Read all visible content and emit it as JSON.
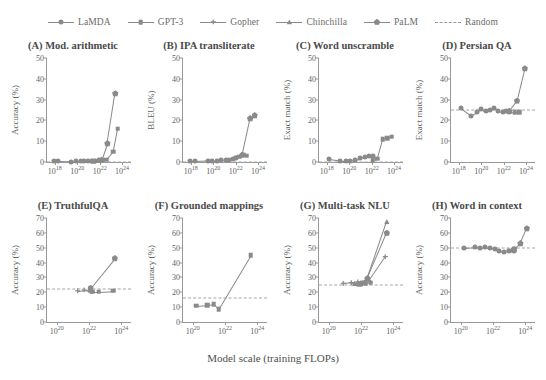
{
  "legend": {
    "items": [
      {
        "label": "LaMDA",
        "marker": "circle",
        "style": "solid"
      },
      {
        "label": "GPT-3",
        "marker": "square",
        "style": "solid"
      },
      {
        "label": "Gopher",
        "marker": "plus",
        "style": "solid"
      },
      {
        "label": "Chinchilla",
        "marker": "triangle",
        "style": "solid"
      },
      {
        "label": "PaLM",
        "marker": "pentagon",
        "style": "solid"
      },
      {
        "label": "Random",
        "marker": "none",
        "style": "dashed"
      }
    ]
  },
  "axis_caption": "Model scale (training FLOPs)",
  "colors": {
    "line": "#8a8a8a",
    "random": "#a5a5a5",
    "axis": "#999999",
    "text": "#5f5f5f",
    "title": "#4a4a4a",
    "background": "#ffffff"
  },
  "chart_data": [
    {
      "id": "A",
      "type": "line",
      "title": "(A) Mod. arithmetic",
      "xlabel": "",
      "ylabel": "Accuracy (%)",
      "xlim_log10": [
        17.3,
        24.8
      ],
      "ylim": [
        0,
        50
      ],
      "yticks": [
        0,
        10,
        20,
        30,
        40,
        50
      ],
      "xticks_log10": [
        18,
        20,
        22,
        24
      ],
      "xticklabels": [
        "10^18",
        "10^20",
        "10^22",
        "10^24"
      ],
      "grid": false,
      "random_baseline": 0,
      "series": [
        {
          "name": "LaMDA",
          "marker": "circle",
          "x_log10": [
            17.9,
            18.3,
            19.4,
            19.9,
            20.3,
            20.6,
            21.0,
            21.3,
            21.6,
            21.9
          ],
          "y": [
            0.3,
            0.3,
            0.2,
            0.4,
            0.3,
            0.5,
            0.4,
            0.6,
            0.5,
            0.8
          ]
        },
        {
          "name": "GPT-3",
          "marker": "square",
          "x_log10": [
            21.4,
            21.9,
            22.2,
            22.6,
            23.2,
            23.6
          ],
          "y": [
            0.4,
            0.6,
            1.0,
            1.2,
            5.0,
            16.0
          ]
        },
        {
          "name": "PaLM",
          "marker": "pentagon",
          "x_log10": [
            22.2,
            22.7,
            23.4
          ],
          "y": [
            1.0,
            9.0,
            33.0
          ]
        }
      ]
    },
    {
      "id": "B",
      "type": "line",
      "title": "(B) IPA transliterate",
      "xlabel": "",
      "ylabel": "BLEU (%)",
      "xlim_log10": [
        17.3,
        24.8
      ],
      "ylim": [
        0,
        50
      ],
      "yticks": [
        0,
        10,
        20,
        30,
        40,
        50
      ],
      "xticks_log10": [
        18,
        20,
        22,
        24
      ],
      "xticklabels": [
        "10^18",
        "10^20",
        "10^22",
        "10^24"
      ],
      "grid": false,
      "random_baseline": 0,
      "series": [
        {
          "name": "LaMDA",
          "marker": "circle",
          "x_log10": [
            17.9,
            18.4,
            19.5,
            19.9,
            20.3,
            20.7,
            21.1,
            21.4,
            21.8,
            22.0
          ],
          "y": [
            0.4,
            0.4,
            0.6,
            0.7,
            0.7,
            0.9,
            1.0,
            1.2,
            1.6,
            2.0
          ]
        },
        {
          "name": "GPT-3",
          "marker": "square",
          "x_log10": [
            22.0,
            22.3,
            22.7,
            23.0
          ],
          "y": [
            2.0,
            2.5,
            3.5,
            3.0
          ]
        },
        {
          "name": "PaLM",
          "marker": "pentagon",
          "x_log10": [
            22.6,
            23.3,
            23.7
          ],
          "y": [
            3.5,
            21.0,
            22.5
          ]
        }
      ]
    },
    {
      "id": "C",
      "type": "line",
      "title": "(C) Word unscramble",
      "xlabel": "",
      "ylabel": "Exact match (%)",
      "xlim_log10": [
        17.3,
        24.8
      ],
      "ylim": [
        0,
        50
      ],
      "yticks": [
        0,
        10,
        20,
        30,
        40,
        50
      ],
      "xticks_log10": [
        18,
        20,
        22,
        24
      ],
      "xticklabels": [
        "10^18",
        "10^20",
        "10^22",
        "10^24"
      ],
      "grid": false,
      "random_baseline": 0,
      "series": [
        {
          "name": "LaMDA",
          "marker": "circle",
          "x_log10": [
            18.2,
            19.2,
            19.7,
            20.1,
            20.5,
            21.0,
            21.4,
            21.8,
            22.1
          ],
          "y": [
            1.3,
            0.5,
            0.5,
            0.7,
            1.2,
            1.8,
            2.4,
            3.0,
            2.8
          ]
        },
        {
          "name": "GPT-3",
          "marker": "square",
          "x_log10": [
            22.1,
            22.5,
            23.0,
            23.4,
            23.8
          ],
          "y": [
            1.0,
            1.5,
            11.0,
            11.5,
            12.2
          ]
        }
      ]
    },
    {
      "id": "D",
      "type": "line",
      "title": "(D) Persian QA",
      "xlabel": "",
      "ylabel": "Exact match (%)",
      "xlim_log10": [
        17.3,
        24.8
      ],
      "ylim": [
        0,
        50
      ],
      "yticks": [
        0,
        10,
        20,
        30,
        40,
        50
      ],
      "xticks_log10": [
        18,
        20,
        22,
        24
      ],
      "xticklabels": [
        "10^18",
        "10^20",
        "10^22",
        "10^24"
      ],
      "grid": false,
      "random_baseline": 25,
      "series": [
        {
          "name": "LaMDA",
          "marker": "circle",
          "x_log10": [
            18.2,
            19.1,
            19.6,
            20.0,
            20.4,
            20.8,
            21.1,
            21.5,
            21.9,
            22.2,
            22.5
          ],
          "y": [
            26.0,
            22.3,
            24.0,
            25.5,
            24.3,
            25.0,
            26.0,
            24.5,
            24.0,
            24.5,
            24.2
          ]
        },
        {
          "name": "GPT-3",
          "marker": "square",
          "x_log10": [
            22.5,
            23.0,
            23.4
          ],
          "y": [
            24.2,
            24.0,
            24.0
          ]
        },
        {
          "name": "PaLM",
          "marker": "pentagon",
          "x_log10": [
            22.5,
            23.2,
            23.9
          ],
          "y": [
            24.5,
            29.5,
            45.0
          ]
        }
      ]
    },
    {
      "id": "E",
      "type": "line",
      "title": "(E) TruthfulQA",
      "xlabel": "",
      "ylabel": "Accuracy (%)",
      "xlim_log10": [
        19.4,
        24.6
      ],
      "ylim": [
        0,
        70
      ],
      "yticks": [
        0,
        10,
        20,
        30,
        40,
        50,
        60,
        70
      ],
      "xticks_log10": [
        20,
        22,
        24
      ],
      "xticklabels": [
        "10^20",
        "10^22",
        "10^24"
      ],
      "grid": false,
      "random_baseline": 22,
      "series": [
        {
          "name": "Gopher",
          "marker": "plus",
          "x_log10": [
            21.3,
            21.7,
            22.0,
            22.2
          ],
          "y": [
            21.0,
            21.5,
            21.0,
            20.5
          ]
        },
        {
          "name": "GPT-3",
          "marker": "square",
          "x_log10": [
            22.2,
            22.6,
            23.5
          ],
          "y": [
            20.5,
            20.5,
            21.0
          ]
        },
        {
          "name": "PaLM",
          "marker": "pentagon",
          "x_log10": [
            22.1,
            23.6
          ],
          "y": [
            23.0,
            43.0
          ]
        }
      ]
    },
    {
      "id": "F",
      "type": "line",
      "title": "(F) Grounded mappings",
      "xlabel": "",
      "ylabel": "Accuracy (%)",
      "xlim_log10": [
        19.4,
        24.6
      ],
      "ylim": [
        0,
        70
      ],
      "yticks": [
        0,
        10,
        20,
        30,
        40,
        50,
        60,
        70
      ],
      "xticks_log10": [
        20,
        22,
        24
      ],
      "xticklabels": [
        "10^20",
        "10^22",
        "10^24"
      ],
      "grid": false,
      "random_baseline": 16,
      "series": [
        {
          "name": "GPT-3",
          "marker": "square",
          "x_log10": [
            20.2,
            20.9,
            21.3,
            21.6,
            23.6
          ],
          "y": [
            11.0,
            11.5,
            12.0,
            8.5,
            45.0
          ]
        }
      ]
    },
    {
      "id": "G",
      "type": "line",
      "title": "(G) Multi-task NLU",
      "xlabel": "",
      "ylabel": "Accuracy (%)",
      "xlim_log10": [
        19.4,
        24.6
      ],
      "ylim": [
        0,
        70
      ],
      "yticks": [
        0,
        10,
        20,
        30,
        40,
        50,
        60,
        70
      ],
      "xticks_log10": [
        20,
        22,
        24
      ],
      "xticklabels": [
        "10^20",
        "10^22",
        "10^24"
      ],
      "grid": false,
      "random_baseline": 25,
      "series": [
        {
          "name": "Gopher",
          "marker": "plus",
          "x_log10": [
            20.9,
            21.4,
            21.8,
            22.1,
            22.5,
            23.5
          ],
          "y": [
            26.0,
            26.5,
            27.0,
            26.5,
            28.0,
            44.0
          ]
        },
        {
          "name": "Chinchilla",
          "marker": "triangle",
          "x_log10": [
            21.6,
            22.0,
            22.4,
            23.6
          ],
          "y": [
            26.0,
            26.0,
            29.5,
            67.5
          ]
        },
        {
          "name": "PaLM",
          "marker": "pentagon",
          "x_log10": [
            22.0,
            22.4,
            23.6
          ],
          "y": [
            26.0,
            29.5,
            60.0
          ]
        },
        {
          "name": "GPT-3",
          "marker": "square",
          "x_log10": [
            21.9,
            22.3,
            22.6
          ],
          "y": [
            25.5,
            26.0,
            26.5
          ]
        }
      ]
    },
    {
      "id": "H",
      "type": "line",
      "title": "(H) Word in context",
      "xlabel": "",
      "ylabel": "Accuracy (%)",
      "xlim_log10": [
        19.4,
        24.6
      ],
      "ylim": [
        0,
        70
      ],
      "yticks": [
        0,
        10,
        20,
        30,
        40,
        50,
        60,
        70
      ],
      "xticks_log10": [
        20,
        22,
        24
      ],
      "xticklabels": [
        "10^20",
        "10^22",
        "10^24"
      ],
      "grid": false,
      "random_baseline": 50,
      "series": [
        {
          "name": "LaMDA",
          "marker": "circle",
          "x_log10": [
            20.2,
            20.9,
            21.2,
            21.5,
            21.8,
            22.1,
            22.4,
            22.7,
            23.0,
            23.3
          ],
          "y": [
            50.0,
            50.5,
            50.0,
            50.5,
            49.5,
            49.0,
            47.5,
            47.0,
            48.0,
            48.0
          ]
        },
        {
          "name": "GPT-3",
          "marker": "square",
          "x_log10": [
            23.0,
            23.3
          ],
          "y": [
            48.0,
            49.0
          ]
        },
        {
          "name": "PaLM",
          "marker": "pentagon",
          "x_log10": [
            23.3,
            23.7,
            24.1
          ],
          "y": [
            49.0,
            53.0,
            63.0
          ]
        }
      ]
    }
  ]
}
